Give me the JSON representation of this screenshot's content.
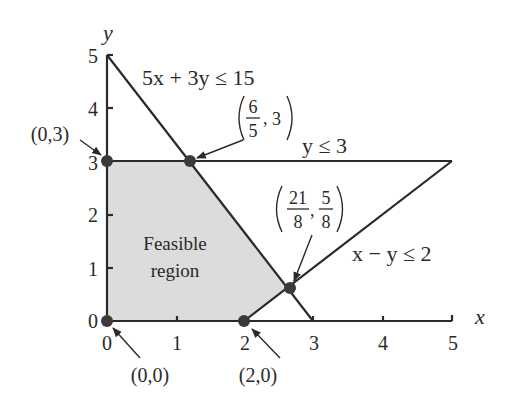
{
  "diagram": {
    "axes": {
      "x_label": "x",
      "y_label": "y",
      "x_ticks": [
        "0",
        "1",
        "2",
        "3",
        "4",
        "5"
      ],
      "y_ticks": [
        "0",
        "1",
        "2",
        "3",
        "4",
        "5"
      ],
      "xlim": [
        0,
        5
      ],
      "ylim": [
        0,
        5
      ]
    },
    "constraints": [
      {
        "label": "5x + 3y ≤ 15",
        "line": [
          [
            0,
            5
          ],
          [
            3,
            0
          ]
        ]
      },
      {
        "label": "y ≤ 3",
        "line": [
          [
            0,
            3
          ],
          [
            5,
            3
          ]
        ]
      },
      {
        "label": "x − y ≤ 2",
        "line": [
          [
            2,
            0
          ],
          [
            5,
            3
          ]
        ]
      }
    ],
    "region_label_line1": "Feasible",
    "region_label_line2": "region",
    "vertices": [
      {
        "label": "(0,0)",
        "x": 0,
        "y": 0
      },
      {
        "label": "(2,0)",
        "x": 2,
        "y": 0
      },
      {
        "label": "(21/8, 5/8)",
        "x": 2.625,
        "y": 0.625
      },
      {
        "label": "(6/5, 3)",
        "x": 1.2,
        "y": 3
      },
      {
        "label": "(0,3)",
        "x": 0,
        "y": 3
      }
    ],
    "labels": {
      "c1": "5x + 3y ≤ 15",
      "c2": "y ≤ 3",
      "c3": "x − y ≤ 2",
      "v00": "(0,0)",
      "v20": "(2,0)",
      "v03": "(0,3)",
      "v_653_num": "6",
      "v_653_den": "5",
      "v_653_y": "3",
      "v_21_num": "21",
      "v_21_den": "8",
      "v_58_num": "5",
      "v_58_den": "8"
    },
    "colors": {
      "region_fill": "#dcdcdc",
      "line": "#2a2a2a",
      "point": "#3a3a3a"
    }
  }
}
